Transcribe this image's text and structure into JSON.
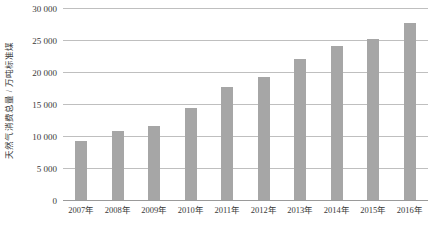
{
  "chart_data": {
    "type": "bar",
    "title": "",
    "subtitle": "",
    "xlabel": "",
    "ylabel": "天然气消费总量 / 万吨标准煤",
    "categories": [
      "2007年",
      "2008年",
      "2009年",
      "2010年",
      "2011年",
      "2012年",
      "2013年",
      "2014年",
      "2015年",
      "2016年"
    ],
    "values": [
      9200,
      10800,
      11600,
      14300,
      17700,
      19200,
      22000,
      24100,
      25200,
      27700
    ],
    "ylim": [
      0,
      30000
    ],
    "ytick_values": [
      0,
      5000,
      10000,
      15000,
      20000,
      25000,
      30000
    ],
    "ytick_labels": [
      "0",
      "5 000",
      "10 000",
      "15 000",
      "20 000",
      "25 000",
      "30 000"
    ],
    "grid": true,
    "legend": false,
    "legend_position": "none",
    "series": [
      {
        "name": "天然气消费总量",
        "color": "#a6a6a6",
        "values": [
          9200,
          10800,
          11600,
          14300,
          17700,
          19200,
          22000,
          24100,
          25200,
          27700
        ]
      }
    ]
  },
  "colors": {
    "bar": "#a6a6a6",
    "grid": "#bfbfbf",
    "axis": "#9a9a9a",
    "text": "#3a3a3a",
    "background": "#ffffff"
  }
}
